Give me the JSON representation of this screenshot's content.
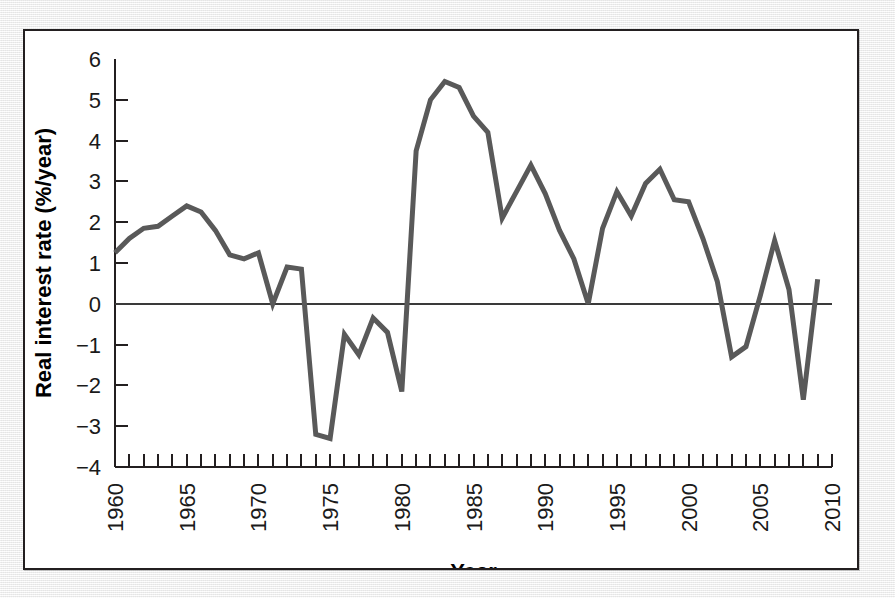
{
  "figure": {
    "background_color": "#f4f4f4",
    "panel_color": "#ffffff",
    "border_color": "#231f20",
    "line_color": "#595959"
  },
  "chart_data": {
    "type": "line",
    "title": "",
    "xlabel": "Year",
    "ylabel": "Real interest rate (%/year)",
    "xlim": [
      1960,
      2010
    ],
    "ylim": [
      -4,
      6
    ],
    "xticks": [
      1960,
      1961,
      1962,
      1963,
      1964,
      1965,
      1966,
      1967,
      1968,
      1969,
      1970,
      1971,
      1972,
      1973,
      1974,
      1975,
      1976,
      1977,
      1978,
      1979,
      1980,
      1981,
      1982,
      1983,
      1984,
      1985,
      1986,
      1987,
      1988,
      1989,
      1990,
      1991,
      1992,
      1993,
      1994,
      1995,
      1996,
      1997,
      1998,
      1999,
      2000,
      2001,
      2002,
      2003,
      2004,
      2005,
      2006,
      2007,
      2008,
      2009,
      2010
    ],
    "xtick_labels": [
      "1960",
      "1965",
      "1970",
      "1975",
      "1980",
      "1985",
      "1990",
      "1995",
      "2000",
      "2005",
      "2010"
    ],
    "xtick_label_values": [
      1960,
      1965,
      1970,
      1975,
      1980,
      1985,
      1990,
      1995,
      2000,
      2005,
      2010
    ],
    "yticks": [
      -4,
      -3,
      -2,
      -1,
      0,
      1,
      2,
      3,
      4,
      5,
      6
    ],
    "ytick_labels": [
      "−4",
      "−3",
      "−2",
      "−1",
      "0",
      "1",
      "2",
      "3",
      "4",
      "5",
      "6"
    ],
    "grid": false,
    "legend": "none",
    "zero_line": 0,
    "x": [
      1960,
      1961,
      1962,
      1963,
      1964,
      1965,
      1966,
      1967,
      1968,
      1969,
      1970,
      1971,
      1972,
      1973,
      1974,
      1975,
      1976,
      1977,
      1978,
      1979,
      1980,
      1981,
      1982,
      1983,
      1984,
      1985,
      1986,
      1987,
      1988,
      1989,
      1990,
      1991,
      1992,
      1993,
      1994,
      1995,
      1996,
      1997,
      1998,
      1999,
      2000,
      2001,
      2002,
      2003,
      2004,
      2005,
      2006,
      2007,
      2008,
      2009
    ],
    "y": [
      1.25,
      1.6,
      1.85,
      1.9,
      2.15,
      2.4,
      2.25,
      1.8,
      1.2,
      1.1,
      1.25,
      0.0,
      0.9,
      0.85,
      -3.2,
      -3.3,
      -0.75,
      -1.25,
      -0.35,
      -0.7,
      -2.15,
      3.75,
      5.0,
      5.45,
      5.3,
      4.6,
      4.2,
      2.1,
      2.75,
      3.4,
      2.7,
      1.8,
      1.1,
      0.0,
      1.85,
      2.75,
      2.15,
      2.95,
      3.3,
      2.55,
      2.5,
      1.6,
      0.55,
      -1.3,
      -1.05,
      0.2,
      1.55,
      0.35,
      -2.35,
      0.6
    ]
  }
}
